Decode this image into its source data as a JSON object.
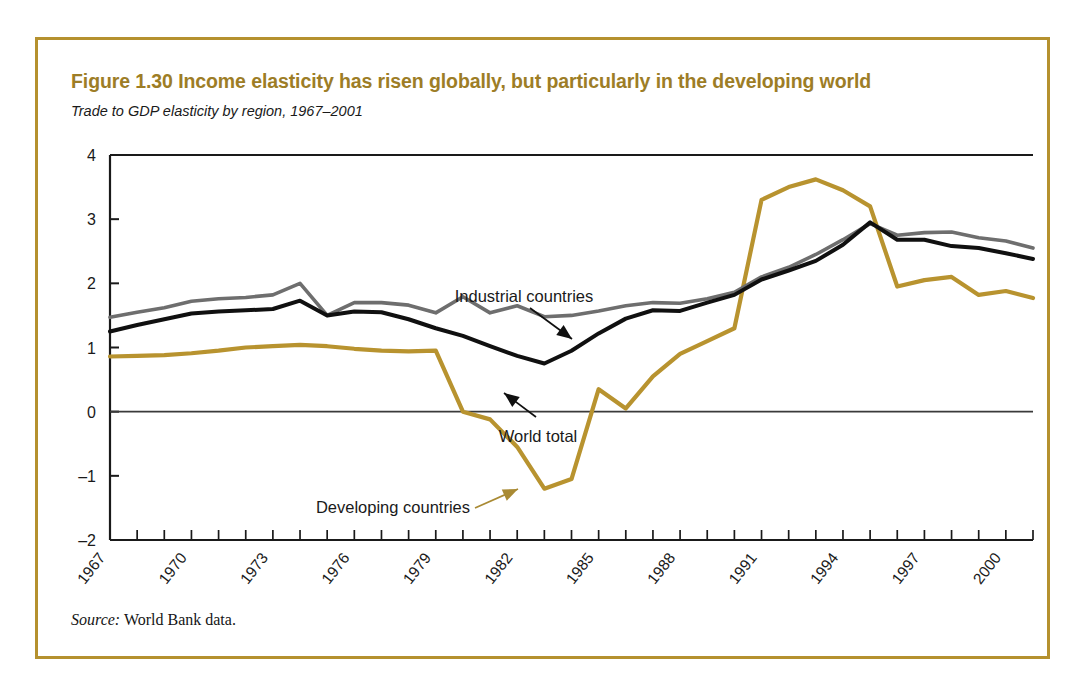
{
  "figure": {
    "title": "Figure 1.30  Income elasticity has risen globally, but particularly in the developing world",
    "subtitle": "Trade to GDP elasticity by region, 1967–2001",
    "source_lead": "Source:",
    "source_text": " World Bank data.",
    "border_color": "#b5912e",
    "title_color": "#9d7d26"
  },
  "chart_data": {
    "type": "line",
    "title": "Figure 1.30  Income elasticity has risen globally, but particularly in the developing world",
    "subtitle": "Trade to GDP elasticity by region, 1967–2001",
    "xlabel": "",
    "ylabel": "",
    "xlim": [
      1967,
      2001
    ],
    "ylim": [
      -2,
      4
    ],
    "ytick_labels": [
      "4",
      "3",
      "2",
      "1",
      "0",
      "-1",
      "-2"
    ],
    "ytick_values": [
      4,
      3,
      2,
      1,
      0,
      -1,
      -2
    ],
    "xtick_values": [
      1967,
      1968,
      1969,
      1970,
      1971,
      1972,
      1973,
      1974,
      1975,
      1976,
      1977,
      1978,
      1979,
      1980,
      1981,
      1982,
      1983,
      1984,
      1985,
      1986,
      1987,
      1988,
      1989,
      1990,
      1991,
      1992,
      1993,
      1994,
      1995,
      1996,
      1997,
      1998,
      1999,
      2000,
      2001
    ],
    "xtick_labels": [
      "1967",
      "1970",
      "1973",
      "1976",
      "1979",
      "1982",
      "1985",
      "1988",
      "1991",
      "1994",
      "1997",
      "2000"
    ],
    "xtick_labels_values": [
      1967,
      1970,
      1973,
      1976,
      1979,
      1982,
      1985,
      1988,
      1991,
      1994,
      1997,
      2000
    ],
    "grid": false,
    "legend_position": "inline-annotations",
    "zero_line": 0,
    "x": [
      1967,
      1968,
      1969,
      1970,
      1971,
      1972,
      1973,
      1974,
      1975,
      1976,
      1977,
      1978,
      1979,
      1980,
      1981,
      1982,
      1983,
      1984,
      1985,
      1986,
      1987,
      1988,
      1989,
      1990,
      1991,
      1992,
      1993,
      1994,
      1995,
      1996,
      1997,
      1998,
      1999,
      2000,
      2001
    ],
    "series": [
      {
        "name": "Industrial countries",
        "color": "#6e6e6e",
        "values": [
          1.47,
          1.55,
          1.62,
          1.72,
          1.76,
          1.78,
          1.82,
          2.0,
          1.5,
          1.7,
          1.7,
          1.66,
          1.54,
          1.79,
          1.54,
          1.65,
          1.48,
          1.5,
          1.57,
          1.65,
          1.7,
          1.69,
          1.76,
          1.86,
          2.1,
          2.25,
          2.45,
          2.68,
          2.93,
          2.75,
          2.79,
          2.8,
          2.71,
          2.66,
          2.55
        ]
      },
      {
        "name": "World total",
        "color": "#101010",
        "values": [
          1.25,
          1.35,
          1.44,
          1.53,
          1.56,
          1.58,
          1.6,
          1.73,
          1.5,
          1.56,
          1.55,
          1.44,
          1.3,
          1.18,
          1.02,
          0.87,
          0.75,
          0.95,
          1.22,
          1.45,
          1.58,
          1.57,
          1.7,
          1.82,
          2.06,
          2.2,
          2.35,
          2.6,
          2.95,
          2.68,
          2.68,
          2.58,
          2.55,
          2.47,
          2.38
        ]
      },
      {
        "name": "Developing countries",
        "color": "#b8932f",
        "values": [
          0.86,
          0.87,
          0.88,
          0.91,
          0.95,
          1.0,
          1.02,
          1.04,
          1.02,
          0.98,
          0.95,
          0.94,
          0.95,
          0.0,
          -0.12,
          -0.55,
          -1.2,
          -1.05,
          0.35,
          0.05,
          0.55,
          0.9,
          1.1,
          1.3,
          3.3,
          3.5,
          3.62,
          3.45,
          3.2,
          1.95,
          2.05,
          2.1,
          1.82,
          1.88,
          1.77
        ]
      }
    ],
    "annotations": [
      {
        "text": "Industrial countries",
        "target_year": 1978,
        "target_value": 1.62
      },
      {
        "text": "World total",
        "target_year": 1978,
        "target_value": 1.1
      },
      {
        "text": "Developing countries",
        "target_year": 1981,
        "target_value": -0.45
      }
    ]
  }
}
